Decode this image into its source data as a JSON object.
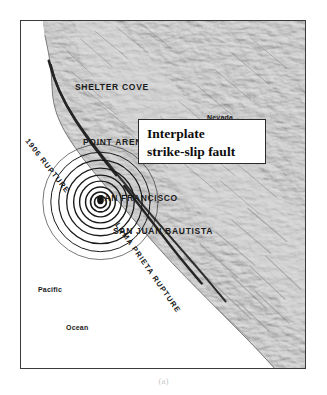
{
  "figure": {
    "subcaption": "(a)",
    "frame": {
      "border_color": "#3a3a3a"
    }
  },
  "callout": {
    "line1": "Interplate",
    "line2": "strike-slip fault",
    "border_color": "#2b2b2b",
    "background": "#ffffff"
  },
  "map": {
    "type": "shaded-relief",
    "region": "Northern California coast",
    "land_color": "#b9b9b9",
    "ocean_color": "#ffffff",
    "fault_color": "#2a2a2a",
    "epicenter_color": "#111111",
    "cities": [
      {
        "name": "SHELTER COVE",
        "x": 54,
        "y": 62
      },
      {
        "name": "POINT ARENA",
        "x": 62,
        "y": 117
      },
      {
        "name": "SAN FRANCISCO",
        "x": 97,
        "y": 177
      },
      {
        "name": "SAN JUAN BAUTISTA",
        "x": 112,
        "y": 210
      }
    ],
    "regions": [
      {
        "name": "Nevada",
        "x": 205,
        "y": 96
      }
    ],
    "ocean_labels": [
      {
        "name": "Pacific",
        "x": 36,
        "y": 287
      },
      {
        "name": "Ocean",
        "x": 64,
        "y": 325
      }
    ],
    "ruptures": [
      {
        "name": "1906 RUPTURE",
        "x": 20,
        "y": 130,
        "angle": 52
      },
      {
        "name": "LOMA PRIETA RUPTURE",
        "x": 110,
        "y": 215,
        "angle": 55
      }
    ],
    "epicenter": {
      "x": 100,
      "y": 202,
      "ring_count": 9
    }
  }
}
